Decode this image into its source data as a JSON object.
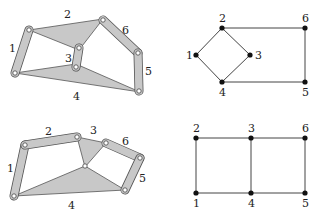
{
  "figures": [
    {
      "id": "mechanism-a",
      "type": "linkage",
      "labels": {
        "1": "1",
        "2": "2",
        "3": "3",
        "4": "4",
        "5": "5",
        "6": "6"
      }
    },
    {
      "id": "graph-a",
      "type": "graph",
      "nodes": [
        "1",
        "2",
        "3",
        "4",
        "5",
        "6"
      ],
      "edges": [
        [
          "1",
          "2"
        ],
        [
          "2",
          "3"
        ],
        [
          "3",
          "4"
        ],
        [
          "4",
          "1"
        ],
        [
          "2",
          "6"
        ],
        [
          "6",
          "5"
        ],
        [
          "5",
          "4"
        ]
      ]
    },
    {
      "id": "mechanism-b",
      "type": "linkage",
      "labels": {
        "1": "1",
        "2": "2",
        "3": "3",
        "4": "4",
        "5": "5",
        "6": "6"
      }
    },
    {
      "id": "graph-b",
      "type": "graph",
      "nodes": [
        "1",
        "2",
        "3",
        "4",
        "5",
        "6"
      ],
      "edges": [
        [
          "1",
          "2"
        ],
        [
          "2",
          "3"
        ],
        [
          "3",
          "6"
        ],
        [
          "6",
          "5"
        ],
        [
          "5",
          "4"
        ],
        [
          "4",
          "1"
        ],
        [
          "3",
          "4"
        ]
      ]
    }
  ],
  "colors": {
    "link_fill": "#c8c8c8",
    "outline": "#555555",
    "node": "#111111"
  }
}
